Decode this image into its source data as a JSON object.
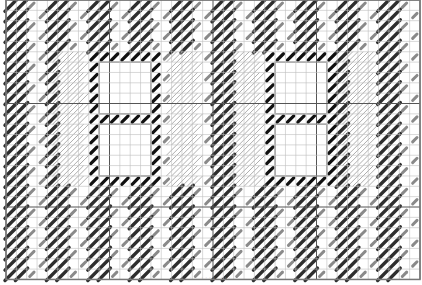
{
  "pattern": {
    "title": "Needlepoint stitch chart",
    "grid": {
      "origin_x": 6,
      "origin_y": 0,
      "cell": 10.35,
      "cols": 40,
      "rows": 27,
      "major_every": 10,
      "minor_color": "#bdbdbd",
      "major_color": "#555555",
      "border_color": "#777777"
    },
    "colors": {
      "dark_stitch": "#2e2e2e",
      "mid_stitch": "#8a8a8a",
      "black_stitch": "#111111",
      "hatch_stitch": "#9a9a9a",
      "window_border": "#999999",
      "window_fill": "#ffffff"
    },
    "windows": [
      {
        "col": 9,
        "row": 6,
        "w": 5,
        "h": 5
      },
      {
        "col": 9,
        "row": 12,
        "w": 5,
        "h": 5
      },
      {
        "col": 26,
        "row": 6,
        "w": 5,
        "h": 5
      },
      {
        "col": 26,
        "row": 12,
        "w": 5,
        "h": 5
      }
    ],
    "frames": [
      {
        "col": 8,
        "row": 5,
        "w": 7,
        "h": 13
      },
      {
        "col": 25,
        "row": 5,
        "w": 7,
        "h": 13
      }
    ],
    "hatch_columns": [
      {
        "col": 5,
        "row": 5,
        "w": 3,
        "h": 13
      },
      {
        "col": 16,
        "row": 5,
        "w": 3,
        "h": 13
      },
      {
        "col": 22,
        "row": 5,
        "w": 3,
        "h": 13
      },
      {
        "col": 33,
        "row": 5,
        "w": 3,
        "h": 13
      }
    ]
  },
  "caption": "·· ···· ···"
}
